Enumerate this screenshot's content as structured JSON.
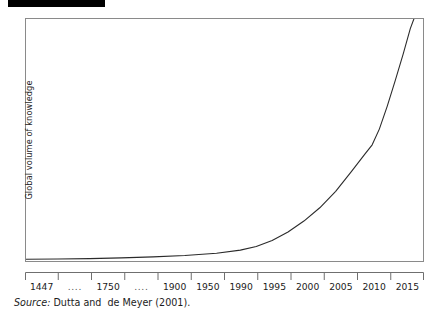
{
  "redaction": {
    "present": true,
    "color": "#000000"
  },
  "figure": {
    "y_axis_title": "Global volume of knowledge",
    "source_label": "Source:",
    "source_text": " Dutta and  de Meyer (2001)."
  },
  "chart_data": {
    "type": "line",
    "title": "",
    "subtitle": "",
    "xlabel": "",
    "ylabel": "Global volume of knowledge",
    "grid": false,
    "legend": "none",
    "annotation": "Source: Dutta and  de Meyer (2001).",
    "tick_labels": [
      "1447",
      "....",
      "1750",
      "....",
      "1900",
      "1950",
      "1990",
      "1995",
      "2000",
      "2005",
      "2010",
      "2015"
    ],
    "axis_note": "x tick labels are centered between 13 evenly spaced tick marks on a rail below the plot box; spacing is categorical, not proportional to years",
    "ylim": [
      0,
      100
    ],
    "yticks": [],
    "series": [
      {
        "name": "Global volume of knowledge",
        "x": [
          "1447",
          "....",
          "1750",
          "....",
          "1900",
          "1950",
          "1990",
          "1995",
          "2000",
          "2005",
          "2010",
          "2015"
        ],
        "values": [
          1,
          1.2,
          1.6,
          2.2,
          3.2,
          5,
          11,
          19,
          33,
          51,
          78,
          112
        ],
        "note": "exponential growth curve; exits the top of the plot frame just before the right edge"
      }
    ],
    "curve_points_normalized": [
      [
        0.0,
        0.993
      ],
      [
        0.08,
        0.992
      ],
      [
        0.16,
        0.99
      ],
      [
        0.24,
        0.987
      ],
      [
        0.32,
        0.983
      ],
      [
        0.4,
        0.977
      ],
      [
        0.48,
        0.968
      ],
      [
        0.54,
        0.955
      ],
      [
        0.58,
        0.94
      ],
      [
        0.62,
        0.915
      ],
      [
        0.66,
        0.88
      ],
      [
        0.7,
        0.835
      ],
      [
        0.74,
        0.78
      ],
      [
        0.78,
        0.712
      ],
      [
        0.82,
        0.63
      ],
      [
        0.855,
        0.555
      ],
      [
        0.872,
        0.52
      ],
      [
        0.89,
        0.455
      ],
      [
        0.91,
        0.36
      ],
      [
        0.93,
        0.255
      ],
      [
        0.95,
        0.145
      ],
      [
        0.968,
        0.04
      ],
      [
        0.977,
        0.0
      ]
    ]
  }
}
